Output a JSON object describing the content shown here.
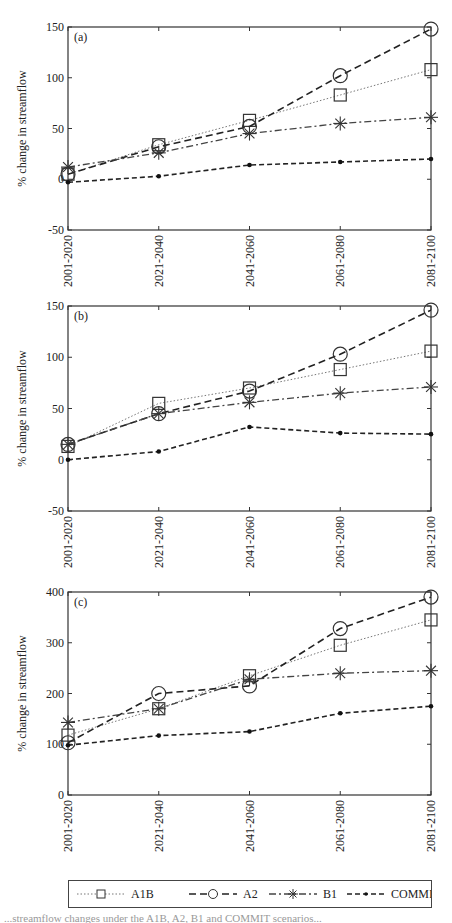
{
  "figure": {
    "x_categories": [
      "2001-2020",
      "2021-2040",
      "2041-2060",
      "2061-2080",
      "2081-2100"
    ],
    "y_axis_label": "% change in streamflow",
    "legend": [
      {
        "name": "A1B",
        "marker": "square",
        "line": "dotted"
      },
      {
        "name": "A2",
        "marker": "circle",
        "line": "dashed"
      },
      {
        "name": "B1",
        "marker": "asterisk",
        "line": "dash-dot"
      },
      {
        "name": "COMMIT",
        "marker": "dot",
        "line": "short-dashed"
      }
    ]
  },
  "chart_data": [
    {
      "type": "line",
      "panel_label": "(a)",
      "title": "",
      "xlabel": "",
      "ylabel": "% change in streamflow",
      "categories": [
        "2001-2020",
        "2021-2040",
        "2041-2060",
        "2061-2080",
        "2081-2100"
      ],
      "ylim": [
        -50,
        150
      ],
      "yticks": [
        -50,
        0,
        50,
        100,
        150
      ],
      "grid": false,
      "legend_position": "bottom (shared)",
      "series": [
        {
          "name": "A1B",
          "values": [
            5,
            34,
            58,
            83,
            108
          ]
        },
        {
          "name": "A2",
          "values": [
            5,
            32,
            52,
            102,
            148
          ]
        },
        {
          "name": "B1",
          "values": [
            12,
            26,
            45,
            55,
            61
          ]
        },
        {
          "name": "COMMIT",
          "values": [
            -3,
            3,
            14,
            17,
            20
          ]
        }
      ]
    },
    {
      "type": "line",
      "panel_label": "(b)",
      "title": "",
      "xlabel": "",
      "ylabel": "% change in streamflow",
      "categories": [
        "2001-2020",
        "2021-2040",
        "2041-2060",
        "2061-2080",
        "2081-2100"
      ],
      "ylim": [
        -50,
        150
      ],
      "yticks": [
        -50,
        0,
        50,
        100,
        150
      ],
      "grid": false,
      "legend_position": "bottom (shared)",
      "series": [
        {
          "name": "A1B",
          "values": [
            13,
            55,
            70,
            88,
            106
          ]
        },
        {
          "name": "A2",
          "values": [
            15,
            45,
            67,
            103,
            146
          ]
        },
        {
          "name": "B1",
          "values": [
            15,
            45,
            56,
            65,
            71
          ]
        },
        {
          "name": "COMMIT",
          "values": [
            0,
            8,
            32,
            26,
            25
          ]
        }
      ]
    },
    {
      "type": "line",
      "panel_label": "(c)",
      "title": "",
      "xlabel": "",
      "ylabel": "% change in streamflow",
      "categories": [
        "2001-2020",
        "2021-2040",
        "2041-2060",
        "2061-2080",
        "2081-2100"
      ],
      "ylim": [
        0,
        400
      ],
      "yticks": [
        0,
        100,
        200,
        300,
        400
      ],
      "grid": false,
      "legend_position": "bottom (shared)",
      "series": [
        {
          "name": "A1B",
          "values": [
            118,
            170,
            235,
            295,
            345
          ]
        },
        {
          "name": "A2",
          "values": [
            103,
            200,
            215,
            328,
            390
          ]
        },
        {
          "name": "B1",
          "values": [
            143,
            170,
            228,
            240,
            245
          ]
        },
        {
          "name": "COMMIT",
          "values": [
            98,
            117,
            125,
            161,
            175
          ]
        }
      ]
    }
  ],
  "caption": {
    "text": "...streamflow changes under the A1B, A2, B1 and COMMIT scenarios..."
  }
}
